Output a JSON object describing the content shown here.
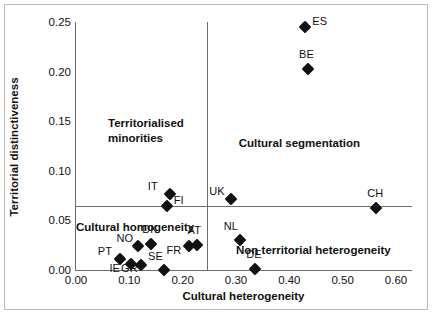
{
  "chart_data": {
    "type": "scatter",
    "title": "",
    "xlabel": "Cultural heterogeneity",
    "ylabel": "Territorial distinctiveness",
    "xlim": [
      0.0,
      0.63
    ],
    "ylim": [
      0.0,
      0.25
    ],
    "xticks": [
      "0.00",
      "0.10",
      "0.20",
      "0.30",
      "0.40",
      "0.50",
      "0.60"
    ],
    "xtick_values": [
      0.0,
      0.1,
      0.2,
      0.3,
      0.4,
      0.5,
      0.6
    ],
    "yticks": [
      "0.00",
      "0.05",
      "0.10",
      "0.15",
      "0.20",
      "0.25"
    ],
    "ytick_values": [
      0.0,
      0.05,
      0.1,
      0.15,
      0.2,
      0.25
    ],
    "grid": false,
    "legend": "none",
    "reference_lines": {
      "horizontal_y": 0.065,
      "vertical_x": 0.245
    },
    "points": [
      {
        "label": "ES",
        "x": 0.43,
        "y": 0.245,
        "label_pos": "right"
      },
      {
        "label": "BE",
        "x": 0.435,
        "y": 0.203,
        "label_pos": "above"
      },
      {
        "label": "CH",
        "x": 0.563,
        "y": 0.062,
        "label_pos": "above"
      },
      {
        "label": "UK",
        "x": 0.291,
        "y": 0.072,
        "label_pos": "left"
      },
      {
        "label": "NL",
        "x": 0.307,
        "y": 0.03,
        "label_pos": "above-left"
      },
      {
        "label": "DE",
        "x": 0.336,
        "y": 0.001,
        "label_pos": "above"
      },
      {
        "label": "IT",
        "x": 0.176,
        "y": 0.077,
        "label_pos": "left"
      },
      {
        "label": "FI",
        "x": 0.17,
        "y": 0.065,
        "label_pos": "right"
      },
      {
        "label": "AT",
        "x": 0.226,
        "y": 0.025,
        "label_pos": "above"
      },
      {
        "label": "FR",
        "x": 0.211,
        "y": 0.024,
        "label_pos": "below-left"
      },
      {
        "label": "SE",
        "x": 0.165,
        "y": 0.0,
        "label_pos": "above-left"
      },
      {
        "label": "DK",
        "x": 0.141,
        "y": 0.026,
        "label_pos": "above"
      },
      {
        "label": "NO",
        "x": 0.117,
        "y": 0.024,
        "label_pos": "left"
      },
      {
        "label": "PT",
        "x": 0.082,
        "y": 0.011,
        "label_pos": "left"
      },
      {
        "label": "IE",
        "x": 0.104,
        "y": 0.006,
        "label_pos": "below-left"
      },
      {
        "label": "GR",
        "x": 0.122,
        "y": 0.005,
        "label_pos": "below"
      }
    ],
    "annotations": [
      {
        "text": "Territorialised minorities",
        "x": 0.06,
        "y": 0.155
      },
      {
        "text": "Cultural segmentation",
        "x": 0.305,
        "y": 0.135
      },
      {
        "text": "Cultural homogeneity",
        "x": 0.0,
        "y": 0.05
      },
      {
        "text": "Non territorial heterogeneity",
        "x": 0.3,
        "y": 0.027
      }
    ]
  },
  "quadrants": {
    "top_left": "Territorialised\nminorities",
    "top_left_line1": "Territorialised",
    "top_left_line2": "minorities",
    "top_right": "Cultural segmentation",
    "bottom_left": "Cultural homogeneity",
    "bottom_right": "Non territorial heterogeneity"
  },
  "axes": {
    "x_title": "Cultural heterogeneity",
    "y_title": "Territorial distinctiveness"
  }
}
